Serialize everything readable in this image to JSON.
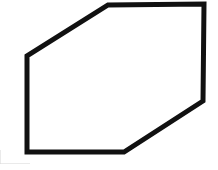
{
  "figure": {
    "shape_name": "hexagon",
    "background_color": "#ffffff",
    "stroke_color": "#111111",
    "fill_color": "#ffffff",
    "stroke_width": 5,
    "canvas": {
      "width": 218,
      "height": 170
    },
    "vertex_count": 6,
    "vertices": [
      {
        "label": "top-left-bend",
        "x": 108,
        "y": 5
      },
      {
        "label": "top-right-corner",
        "x": 204,
        "y": 4
      },
      {
        "label": "right-bend",
        "x": 203,
        "y": 101
      },
      {
        "label": "bottom-right-bend",
        "x": 124,
        "y": 152
      },
      {
        "label": "bottom-left-corner",
        "x": 27,
        "y": 152
      },
      {
        "label": "left-bend",
        "x": 27,
        "y": 56
      }
    ],
    "points_attr": "108,5 204,4 203,101 124,152 27,152 27,56",
    "edges": [
      {
        "name": "top-edge",
        "from": "top-left-bend",
        "to": "top-right-corner",
        "orientation": "horizontal"
      },
      {
        "name": "right-edge",
        "from": "top-right-corner",
        "to": "right-bend",
        "orientation": "vertical"
      },
      {
        "name": "lower-right-diagonal",
        "from": "right-bend",
        "to": "bottom-right-bend",
        "orientation": "diagonal"
      },
      {
        "name": "bottom-edge",
        "from": "bottom-right-bend",
        "to": "bottom-left-corner",
        "orientation": "horizontal"
      },
      {
        "name": "left-edge",
        "from": "bottom-left-corner",
        "to": "left-bend",
        "orientation": "vertical"
      },
      {
        "name": "upper-left-diagonal",
        "from": "left-bend",
        "to": "top-left-bend",
        "orientation": "diagonal"
      }
    ]
  }
}
